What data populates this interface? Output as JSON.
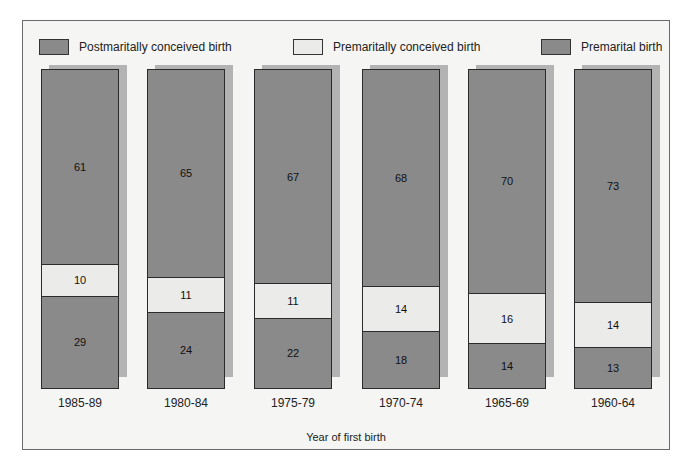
{
  "chart_data": {
    "type": "bar",
    "stacked": true,
    "orientation": "vertical",
    "title": "",
    "xlabel": "Year of first birth",
    "ylabel": "",
    "ylim": [
      0,
      100
    ],
    "grid": false,
    "legend_position": "top",
    "categories": [
      "1985-89",
      "1980-84",
      "1975-79",
      "1970-74",
      "1965-69",
      "1960-64"
    ],
    "series": [
      {
        "name": "Postmaritally conceived birth",
        "color": "#8a8a8a",
        "values": [
          61,
          65,
          67,
          68,
          70,
          73
        ]
      },
      {
        "name": "Premaritally conceived birth",
        "color": "#ebebea",
        "values": [
          10,
          11,
          11,
          14,
          16,
          14
        ]
      },
      {
        "name": "Premarital birth",
        "color": "#8a8a8a",
        "values": [
          29,
          24,
          22,
          18,
          14,
          13
        ]
      }
    ]
  },
  "legend": [
    {
      "label": "Postmaritally conceived birth",
      "color": "#8a8a8a"
    },
    {
      "label": "Premaritally conceived birth",
      "color": "#ebebea"
    },
    {
      "label": "Premarital birth",
      "color": "#8a8a8a"
    }
  ],
  "colors": {
    "frame_bg": "#f5f5f4",
    "shadow": "#b3b3b3",
    "dark_segment": "#8a8a8a",
    "light_segment": "#ebebea"
  }
}
